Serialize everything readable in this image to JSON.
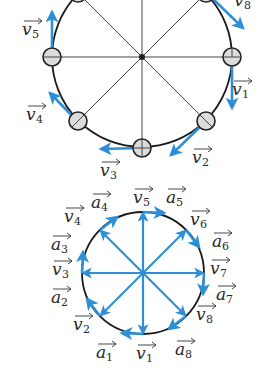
{
  "colors": {
    "vector": "#2f8fd6",
    "circle": "#1a1a1a",
    "spoke": "#444444",
    "ball_fill": "#dcdcdc"
  },
  "top_diagram": {
    "description": "Circular motion: 8 balls on a circle with velocity vectors tangent to the circle",
    "labels": [
      {
        "name": "v",
        "sub": "1",
        "x": 232,
        "y": 95
      },
      {
        "name": "v",
        "sub": "2",
        "x": 192,
        "y": 163
      },
      {
        "name": "v",
        "sub": "3",
        "x": 100,
        "y": 176
      },
      {
        "name": "v",
        "sub": "4",
        "x": 26,
        "y": 120
      },
      {
        "name": "v",
        "sub": "5",
        "x": 22,
        "y": 35
      },
      {
        "name": "v",
        "sub": "8",
        "x": 234,
        "y": 6
      }
    ]
  },
  "bottom_diagram": {
    "description": "Hodograph: velocity vectors v1..v8 drawn from a common origin, with acceleration vectors a1..a8 tangent to the hodograph circle",
    "labels": [
      {
        "name": "v",
        "sub": "5",
        "x": 133,
        "y": 203
      },
      {
        "name": "a",
        "sub": "5",
        "x": 166,
        "y": 203
      },
      {
        "name": "a",
        "sub": "4",
        "x": 91,
        "y": 208
      },
      {
        "name": "v",
        "sub": "4",
        "x": 64,
        "y": 222
      },
      {
        "name": "v",
        "sub": "6",
        "x": 190,
        "y": 225
      },
      {
        "name": "a",
        "sub": "6",
        "x": 212,
        "y": 247
      },
      {
        "name": "a",
        "sub": "3",
        "x": 51,
        "y": 250
      },
      {
        "name": "v",
        "sub": "3",
        "x": 52,
        "y": 275
      },
      {
        "name": "v",
        "sub": "7",
        "x": 210,
        "y": 274
      },
      {
        "name": "a",
        "sub": "7",
        "x": 216,
        "y": 300
      },
      {
        "name": "a",
        "sub": "2",
        "x": 51,
        "y": 303
      },
      {
        "name": "v",
        "sub": "8",
        "x": 196,
        "y": 320
      },
      {
        "name": "v",
        "sub": "2",
        "x": 73,
        "y": 330
      },
      {
        "name": "a",
        "sub": "1",
        "x": 96,
        "y": 358
      },
      {
        "name": "v",
        "sub": "1",
        "x": 136,
        "y": 359
      },
      {
        "name": "a",
        "sub": "8",
        "x": 175,
        "y": 355
      }
    ]
  }
}
